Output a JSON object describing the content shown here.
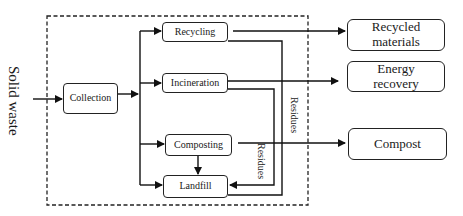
{
  "diagram": {
    "input": "Solid waste",
    "nodes": {
      "collection": "Collection",
      "recycling": "Recycling",
      "incineration": "Incineration",
      "composting": "Composting",
      "landfill": "Landfill"
    },
    "outputs": {
      "recycled_line1": "Recycled",
      "recycled_line2": "materials",
      "energy_line1": "Energy",
      "energy_line2": "recovery",
      "compost": "Compost"
    },
    "edge_labels": {
      "residues_outer": "Residues",
      "residues_inner": "Residues"
    },
    "edges": [
      {
        "from": "Solid waste",
        "to": "Collection"
      },
      {
        "from": "Collection",
        "to": "Recycling"
      },
      {
        "from": "Collection",
        "to": "Incineration"
      },
      {
        "from": "Collection",
        "to": "Composting"
      },
      {
        "from": "Collection",
        "to": "Landfill"
      },
      {
        "from": "Recycling",
        "to": "Recycled materials"
      },
      {
        "from": "Incineration",
        "to": "Energy recovery"
      },
      {
        "from": "Composting",
        "to": "Compost"
      },
      {
        "from": "Composting",
        "to": "Landfill"
      },
      {
        "from": "Recycling",
        "to": "Landfill",
        "label": "Residues"
      },
      {
        "from": "Incineration",
        "to": "Landfill",
        "label": "Residues"
      }
    ]
  }
}
